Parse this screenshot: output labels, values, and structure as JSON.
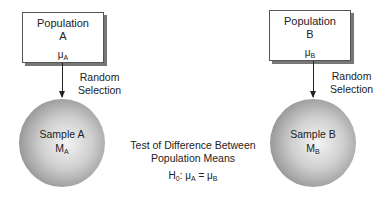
{
  "population_a": {
    "title": "Population",
    "label": "A",
    "param": "μ",
    "param_sub": "A"
  },
  "population_b": {
    "title": "Population",
    "label": "B",
    "param": "μ",
    "param_sub": "B"
  },
  "arrow_a_label": {
    "line1": "Random",
    "line2": "Selection"
  },
  "arrow_b_label": {
    "line1": "Random",
    "line2": "Selection"
  },
  "sample_a": {
    "title": "Sample A",
    "stat": "M",
    "stat_sub": "A"
  },
  "sample_b": {
    "title": "Sample B",
    "stat": "M",
    "stat_sub": "B"
  },
  "test": {
    "line1": "Test of Difference Between",
    "line2": "Population Means"
  },
  "hypothesis": {
    "h": "H",
    "h_sub": "0",
    "sep": ": ",
    "mu1": "μ",
    "mu1_sub": "A",
    "eq": " = ",
    "mu2": "μ",
    "mu2_sub": "B"
  }
}
